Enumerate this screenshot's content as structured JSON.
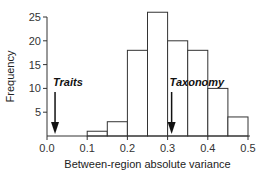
{
  "chart_data": {
    "type": "bar",
    "title": "",
    "xlabel": "Between-region absolute variance",
    "ylabel": "Frequency",
    "bins": [
      {
        "start": 0.1,
        "end": 0.15,
        "value": 1
      },
      {
        "start": 0.15,
        "end": 0.2,
        "value": 3
      },
      {
        "start": 0.2,
        "end": 0.25,
        "value": 18
      },
      {
        "start": 0.25,
        "end": 0.3,
        "value": 26
      },
      {
        "start": 0.3,
        "end": 0.35,
        "value": 20
      },
      {
        "start": 0.35,
        "end": 0.4,
        "value": 18
      },
      {
        "start": 0.4,
        "end": 0.45,
        "value": 10
      },
      {
        "start": 0.45,
        "end": 0.5,
        "value": 4
      }
    ],
    "xlim": [
      0.0,
      0.5
    ],
    "ylim": [
      0,
      25
    ],
    "xticks": [
      "0.0",
      "0.1",
      "0.2",
      "0.3",
      "0.4",
      "0.5"
    ],
    "xtick_values": [
      0.0,
      0.1,
      0.2,
      0.3,
      0.4,
      0.5
    ],
    "yticks": [
      "5",
      "10",
      "15",
      "20",
      "25"
    ],
    "ytick_values": [
      5,
      10,
      15,
      20,
      25
    ],
    "grid": false,
    "annotations": [
      {
        "label": "Traits",
        "x": 0.02,
        "type": "arrow"
      },
      {
        "label": "Taxonomy",
        "x": 0.31,
        "type": "arrow"
      }
    ],
    "bar_fill": "#ffffff",
    "bar_stroke": "#333333"
  }
}
